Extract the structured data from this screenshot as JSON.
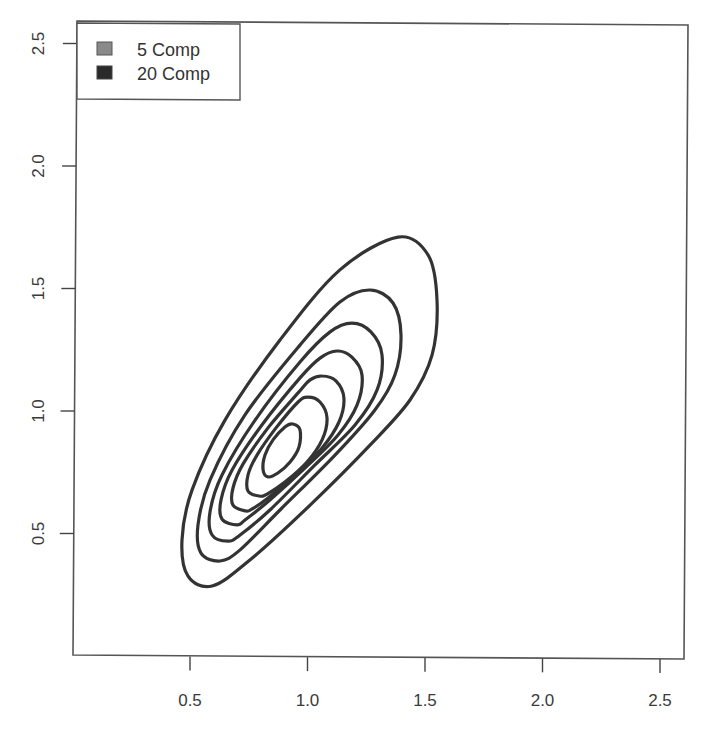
{
  "chart_data": {
    "type": "contour",
    "title": "",
    "xlabel": "",
    "ylabel": "",
    "xlim": [
      0.0,
      2.6
    ],
    "ylim": [
      0.0,
      2.6
    ],
    "grid": false,
    "x_ticks": [
      0.5,
      1.0,
      1.5,
      2.0,
      2.5
    ],
    "x_tick_labels": [
      "0.5",
      "1.0",
      "1.5",
      "2.0",
      "2.5"
    ],
    "y_ticks": [
      0.5,
      1.0,
      1.5,
      2.0,
      2.5
    ],
    "y_tick_labels": [
      "0.5",
      "1.0",
      "1.5",
      "2.0",
      "2.5"
    ],
    "legend": {
      "position": "topleft",
      "entries": [
        {
          "label": "5 Comp",
          "color": "#8a8a8a"
        },
        {
          "label": "20 Comp",
          "color": "#2a2a2a"
        }
      ]
    },
    "series": [
      {
        "name": "density contours",
        "color": "#333333",
        "contour_count": 7,
        "contours": [
          {
            "level": 1,
            "x": [
              1.385,
              1.513,
              1.551,
              1.53,
              1.436,
              1.266,
              1.011,
              0.755,
              0.594,
              0.491,
              0.466,
              0.509,
              0.649,
              0.883,
              1.138
            ],
            "y": [
              1.714,
              1.641,
              1.457,
              1.233,
              1.049,
              0.865,
              0.62,
              0.396,
              0.29,
              0.331,
              0.478,
              0.682,
              0.967,
              1.294,
              1.58
            ]
          },
          {
            "level": 2,
            "x": [
              1.266,
              1.364,
              1.398,
              1.372,
              1.287,
              1.117,
              0.883,
              0.713,
              0.628,
              0.547,
              0.534,
              0.585,
              0.734,
              0.968,
              1.138
            ],
            "y": [
              1.498,
              1.445,
              1.314,
              1.151,
              1.008,
              0.824,
              0.6,
              0.437,
              0.392,
              0.424,
              0.539,
              0.722,
              0.988,
              1.273,
              1.449
            ]
          },
          {
            "level": 3,
            "x": [
              1.189,
              1.27,
              1.317,
              1.296,
              1.202,
              1.032,
              0.84,
              0.713,
              0.662,
              0.594,
              0.585,
              0.636,
              0.777,
              0.968,
              1.096
            ],
            "y": [
              1.363,
              1.327,
              1.233,
              1.09,
              0.947,
              0.784,
              0.6,
              0.498,
              0.473,
              0.498,
              0.592,
              0.743,
              0.967,
              1.204,
              1.327
            ]
          },
          {
            "level": 4,
            "x": [
              1.126,
              1.189,
              1.232,
              1.211,
              1.13,
              0.989,
              0.84,
              0.734,
              0.7,
              0.636,
              0.632,
              0.679,
              0.806,
              0.968,
              1.053
            ],
            "y": [
              1.249,
              1.224,
              1.151,
              1.029,
              0.906,
              0.771,
              0.641,
              0.559,
              0.539,
              0.563,
              0.641,
              0.763,
              0.947,
              1.139,
              1.22
            ]
          },
          {
            "level": 5,
            "x": [
              1.062,
              1.121,
              1.155,
              1.134,
              1.062,
              0.947,
              0.832,
              0.764,
              0.738,
              0.683,
              0.683,
              0.726,
              0.832,
              0.96,
              1.011
            ],
            "y": [
              1.147,
              1.127,
              1.057,
              0.959,
              0.853,
              0.743,
              0.649,
              0.604,
              0.596,
              0.62,
              0.69,
              0.788,
              0.935,
              1.078,
              1.131
            ]
          },
          {
            "level": 6,
            "x": [
              1.002,
              1.053,
              1.083,
              1.062,
              0.998,
              0.904,
              0.828,
              0.794,
              0.747,
              0.747,
              0.785,
              0.866,
              0.96
            ],
            "y": [
              1.061,
              1.041,
              0.976,
              0.886,
              0.796,
              0.714,
              0.665,
              0.657,
              0.678,
              0.743,
              0.824,
              0.935,
              1.041
            ]
          },
          {
            "level": 7,
            "x": [
              0.938,
              0.968,
              0.964,
              0.926,
              0.874,
              0.832,
              0.811,
              0.819,
              0.853,
              0.904
            ],
            "y": [
              0.951,
              0.927,
              0.857,
              0.796,
              0.751,
              0.735,
              0.763,
              0.824,
              0.886,
              0.939
            ]
          }
        ]
      }
    ]
  }
}
